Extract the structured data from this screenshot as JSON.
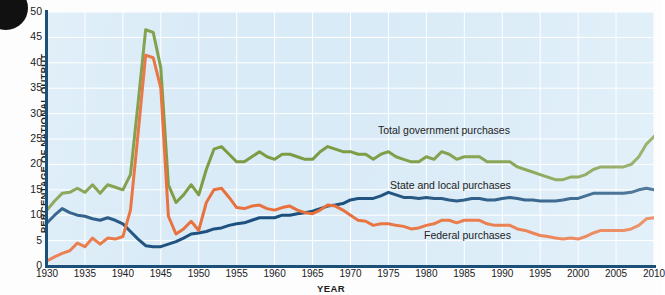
{
  "figure": {
    "bullet_marker": "black-circle-bullet",
    "x_axis_title": "YEAR",
    "y_axis_title": "PERCENTAGE OF NATIONAL OUTPUT"
  },
  "colors": {
    "plot_background": "#d9ebf7",
    "gridline": "#ffffff",
    "axis": "#1d5079",
    "total_government": "#7d9b43",
    "state_and_local": "#1b4f7d",
    "federal": "#e8703c",
    "text": "#1b1b1b"
  },
  "axes": {
    "y_ticks": [
      "0",
      "5",
      "10",
      "15",
      "20",
      "25",
      "30",
      "35",
      "40",
      "45",
      "50"
    ],
    "x_ticks": [
      "1930",
      "1935",
      "1940",
      "1945",
      "1950",
      "1955",
      "1960",
      "1965",
      "1970",
      "1975",
      "1980",
      "1985",
      "1990",
      "1995",
      "2000",
      "2005",
      "2010"
    ]
  },
  "annotations": {
    "total_government": "Total government purchases",
    "state_and_local": "State and local purchases",
    "federal": "Federal purchases"
  },
  "chart_data": {
    "type": "line",
    "title": "",
    "subtitle": "",
    "xlabel": "YEAR",
    "ylabel": "PERCENTAGE OF NATIONAL OUTPUT",
    "xlim": [
      1930,
      2010
    ],
    "ylim": [
      0,
      50
    ],
    "grid": true,
    "legend_position": "inline-annotations",
    "x": [
      1930,
      1931,
      1932,
      1933,
      1934,
      1935,
      1936,
      1937,
      1938,
      1939,
      1940,
      1941,
      1942,
      1943,
      1944,
      1945,
      1946,
      1947,
      1948,
      1949,
      1950,
      1951,
      1952,
      1953,
      1954,
      1955,
      1956,
      1957,
      1958,
      1959,
      1960,
      1961,
      1962,
      1963,
      1964,
      1965,
      1966,
      1967,
      1968,
      1969,
      1970,
      1971,
      1972,
      1973,
      1974,
      1975,
      1976,
      1977,
      1978,
      1979,
      1980,
      1981,
      1982,
      1983,
      1984,
      1985,
      1986,
      1987,
      1988,
      1989,
      1990,
      1991,
      1992,
      1993,
      1994,
      1995,
      1996,
      1997,
      1998,
      1999,
      2000,
      2001,
      2002,
      2003,
      2004,
      2005,
      2006,
      2007,
      2008,
      2009,
      2010
    ],
    "series": [
      {
        "name": "Total government purchases",
        "color": "#7d9b43",
        "values": [
          11.0,
          12.8,
          14.3,
          14.5,
          15.3,
          14.5,
          16.0,
          14.3,
          16.0,
          15.5,
          15.0,
          18.0,
          32.0,
          46.5,
          46.0,
          39.0,
          16.0,
          12.5,
          14.0,
          16.0,
          14.0,
          19.0,
          23.0,
          23.5,
          22.0,
          20.5,
          20.5,
          21.5,
          22.5,
          21.5,
          21.0,
          22.0,
          22.0,
          21.5,
          21.0,
          21.0,
          22.5,
          23.5,
          23.0,
          22.5,
          22.5,
          22.0,
          22.0,
          21.0,
          22.0,
          22.5,
          21.5,
          21.0,
          20.5,
          20.5,
          21.5,
          21.0,
          22.5,
          22.0,
          21.0,
          21.5,
          21.5,
          21.5,
          20.5,
          20.5,
          20.5,
          20.5,
          19.5,
          19.0,
          18.5,
          18.0,
          17.5,
          17.0,
          17.0,
          17.5,
          17.5,
          18.0,
          19.0,
          19.5,
          19.5,
          19.5,
          19.5,
          20.0,
          21.5,
          24.0,
          25.5
        ]
      },
      {
        "name": "State and local purchases",
        "color": "#1b4f7d",
        "values": [
          8.5,
          10.0,
          11.3,
          10.5,
          10.0,
          9.8,
          9.3,
          9.0,
          9.5,
          9.0,
          8.3,
          6.8,
          5.3,
          4.0,
          3.8,
          3.8,
          4.3,
          4.8,
          5.5,
          6.3,
          6.5,
          6.8,
          7.3,
          7.5,
          8.0,
          8.3,
          8.5,
          9.0,
          9.5,
          9.5,
          9.5,
          10.0,
          10.0,
          10.3,
          10.5,
          10.8,
          11.3,
          11.8,
          12.0,
          12.3,
          13.0,
          13.3,
          13.3,
          13.3,
          13.8,
          14.5,
          14.0,
          13.5,
          13.5,
          13.3,
          13.5,
          13.3,
          13.3,
          13.0,
          12.8,
          13.0,
          13.3,
          13.3,
          13.0,
          13.0,
          13.3,
          13.5,
          13.3,
          13.0,
          13.0,
          12.8,
          12.8,
          12.8,
          13.0,
          13.3,
          13.3,
          13.8,
          14.3,
          14.3,
          14.3,
          14.3,
          14.3,
          14.5,
          15.0,
          15.3,
          15.0
        ]
      },
      {
        "name": "Federal purchases",
        "color": "#e8703c",
        "values": [
          1.0,
          1.8,
          2.5,
          3.0,
          4.5,
          3.8,
          5.5,
          4.3,
          5.5,
          5.3,
          5.8,
          11.0,
          26.0,
          41.5,
          41.0,
          35.0,
          9.8,
          6.3,
          7.3,
          8.8,
          7.0,
          12.5,
          15.0,
          15.3,
          13.5,
          11.5,
          11.3,
          11.8,
          12.0,
          11.3,
          11.0,
          11.5,
          11.8,
          11.0,
          10.5,
          10.3,
          11.0,
          12.0,
          11.8,
          11.0,
          10.0,
          9.0,
          8.8,
          8.0,
          8.3,
          8.3,
          8.0,
          7.8,
          7.3,
          7.5,
          8.0,
          8.3,
          9.0,
          9.0,
          8.5,
          9.0,
          9.0,
          9.0,
          8.3,
          8.0,
          8.0,
          8.0,
          7.3,
          7.0,
          6.5,
          6.0,
          5.8,
          5.5,
          5.3,
          5.5,
          5.3,
          5.8,
          6.5,
          7.0,
          7.0,
          7.0,
          7.0,
          7.3,
          8.0,
          9.3,
          9.5
        ]
      }
    ]
  }
}
